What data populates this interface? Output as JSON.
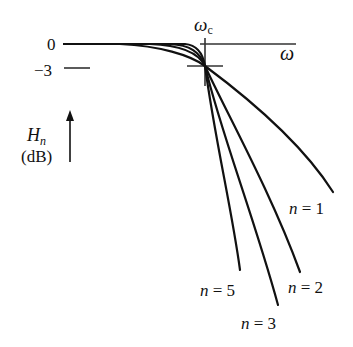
{
  "diagram": {
    "type": "butterworth-lowpass-response",
    "y_axis": {
      "label_main": "H",
      "label_sub": "n",
      "unit": "(dB)",
      "ticks": [
        {
          "label": "0",
          "value_db": 0
        },
        {
          "label": "−3",
          "value_db": -3
        }
      ]
    },
    "x_axis": {
      "label": "ω",
      "cutoff_label_main": "ω",
      "cutoff_label_sub": "c"
    },
    "curves": [
      {
        "order": 1,
        "label": "n = 1"
      },
      {
        "order": 2,
        "label": "n = 2"
      },
      {
        "order": 3,
        "label": "n = 3"
      },
      {
        "order": 5,
        "label": "n = 5"
      }
    ],
    "colors": {
      "line": "#111111",
      "axis": "#333333",
      "background": "#ffffff"
    }
  }
}
